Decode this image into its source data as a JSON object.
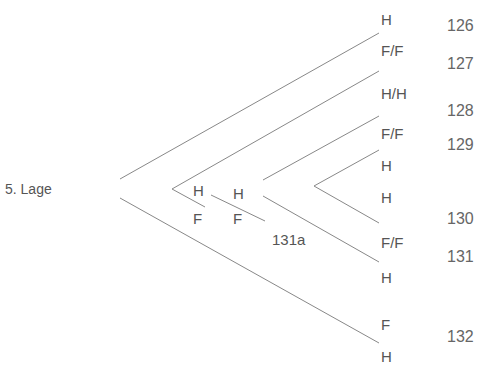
{
  "diagram": {
    "root_label": "5. Lage",
    "line_color": "#888888",
    "text_color": "#555555",
    "leaf_labels": [
      {
        "text": "H",
        "x": 381,
        "y": 12
      },
      {
        "text": "F/F",
        "x": 381,
        "y": 43
      },
      {
        "text": "H/H",
        "x": 381,
        "y": 86
      },
      {
        "text": "F/F",
        "x": 381,
        "y": 126
      },
      {
        "text": "H",
        "x": 381,
        "y": 158
      },
      {
        "text": "H",
        "x": 381,
        "y": 190
      },
      {
        "text": "F/F",
        "x": 381,
        "y": 235
      },
      {
        "text": "H",
        "x": 381,
        "y": 270
      },
      {
        "text": "F",
        "x": 381,
        "y": 317
      },
      {
        "text": "H",
        "x": 381,
        "y": 349
      }
    ],
    "numbers": [
      {
        "text": "126",
        "x": 447,
        "y": 18
      },
      {
        "text": "127",
        "x": 447,
        "y": 56
      },
      {
        "text": "128",
        "x": 447,
        "y": 103
      },
      {
        "text": "129",
        "x": 447,
        "y": 137
      },
      {
        "text": "130",
        "x": 447,
        "y": 211
      },
      {
        "text": "131",
        "x": 447,
        "y": 249
      },
      {
        "text": "132",
        "x": 447,
        "y": 329
      }
    ],
    "inner_labels": [
      {
        "text": "H",
        "x": 193,
        "y": 183
      },
      {
        "text": "F",
        "x": 193,
        "y": 211
      },
      {
        "text": "H",
        "x": 233,
        "y": 186
      },
      {
        "text": "F",
        "x": 233,
        "y": 211
      },
      {
        "text": "131a",
        "x": 272,
        "y": 232
      }
    ],
    "lines": [
      {
        "x1": 120,
        "y1": 179,
        "x2": 379,
        "y2": 33
      },
      {
        "x1": 120,
        "y1": 198,
        "x2": 379,
        "y2": 343
      },
      {
        "x1": 172,
        "y1": 189,
        "x2": 379,
        "y2": 71
      },
      {
        "x1": 172,
        "y1": 189,
        "x2": 205,
        "y2": 207
      },
      {
        "x1": 211,
        "y1": 195,
        "x2": 265,
        "y2": 221
      },
      {
        "x1": 263,
        "y1": 180,
        "x2": 379,
        "y2": 116
      },
      {
        "x1": 263,
        "y1": 196,
        "x2": 379,
        "y2": 262
      },
      {
        "x1": 314,
        "y1": 186,
        "x2": 379,
        "y2": 150
      },
      {
        "x1": 314,
        "y1": 186,
        "x2": 379,
        "y2": 223
      }
    ]
  }
}
